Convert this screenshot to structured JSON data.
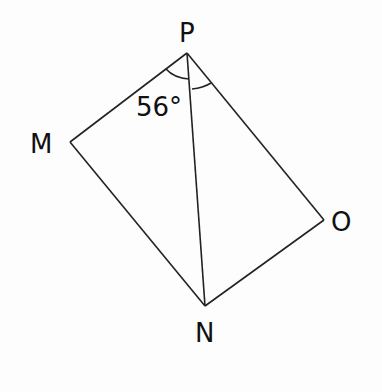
{
  "diagram": {
    "type": "quadrilateral-geometry",
    "vertices": {
      "P": {
        "label": "P",
        "x": 187,
        "y": 53
      },
      "M": {
        "label": "M",
        "x": 70,
        "y": 142
      },
      "N": {
        "label": "N",
        "x": 205,
        "y": 306
      },
      "O": {
        "label": "O",
        "x": 324,
        "y": 220
      }
    },
    "segments": [
      "PM",
      "MN",
      "NO",
      "OP",
      "PN"
    ],
    "angle_annotation": {
      "text": "56°",
      "vertex": "P",
      "between": [
        "PM",
        "PN"
      ]
    },
    "second_angle_arc": {
      "vertex": "P",
      "between": [
        "PN",
        "PO"
      ]
    },
    "colors": {
      "line": "#222222",
      "text": "#111111",
      "background": "#fdfdfd"
    }
  }
}
